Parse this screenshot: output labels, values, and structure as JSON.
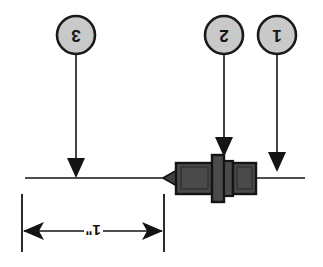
{
  "figure": {
    "orientation_note": "rotated-180",
    "background_color": "#ffffff"
  },
  "colors": {
    "line": "#141414",
    "callout_fill": "#c9c9c9",
    "callout_stroke": "#1a1a1a",
    "connector_body": "#4a4a4a",
    "connector_body_dark": "#3a3a3a",
    "connector_outline": "#141414",
    "cable": "#141414"
  },
  "callouts": [
    {
      "id": "callout-3",
      "label": "3",
      "circle": {
        "cx": 76,
        "cy": 35,
        "r": 19
      },
      "leader": {
        "x": 76,
        "y1": 54,
        "y2": 172
      },
      "arrow_tip_y": 176
    },
    {
      "id": "callout-2",
      "label": "2",
      "circle": {
        "cx": 224,
        "cy": 35,
        "r": 19
      },
      "leader": {
        "x": 224,
        "y1": 54,
        "y2": 152
      },
      "arrow_tip_y": 156
    },
    {
      "id": "callout-1",
      "label": "1",
      "circle": {
        "cx": 277,
        "cy": 35,
        "r": 19
      },
      "leader": {
        "x": 277,
        "y1": 54,
        "y2": 166
      },
      "arrow_tip_y": 170
    }
  ],
  "cable": {
    "label": "cable-centerline",
    "x1": 25,
    "x2": 305,
    "y": 178
  },
  "connector": {
    "label": "fiber-optic-connector",
    "tip_x": 163,
    "rear_x": 256,
    "center_y": 178
  },
  "dimension": {
    "label": "1\"",
    "value": "1",
    "unit": "\"",
    "line_y": 231,
    "left_x": 22,
    "right_x": 164,
    "extension_top_y": 192,
    "extension_bottom_y": 252
  }
}
